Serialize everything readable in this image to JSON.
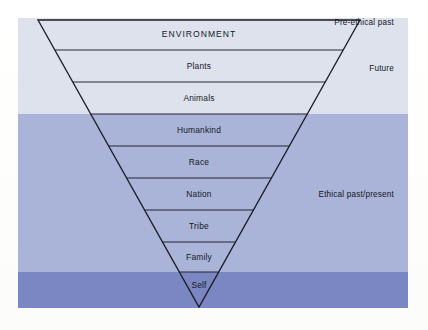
{
  "figure": {
    "type": "inverted-triangle-hierarchy-diagram",
    "palette": {
      "band_future": "#dde2ed",
      "band_ethical": "#aab4d8",
      "band_preethical": "#7b87c2",
      "line": "#1b1e26",
      "text": "#16181e",
      "page": "#fdfdfb"
    }
  },
  "triangle": {
    "rows": [
      {
        "label": "ENVIRONMENT",
        "caps": true,
        "center_x": 199,
        "center_y": 34
      },
      {
        "label": "Plants",
        "caps": false,
        "center_x": 199,
        "center_y": 66
      },
      {
        "label": "Animals",
        "caps": false,
        "center_x": 199,
        "center_y": 98
      },
      {
        "label": "Humankind",
        "caps": false,
        "center_x": 199,
        "center_y": 130
      },
      {
        "label": "Race",
        "caps": false,
        "center_x": 199,
        "center_y": 162
      },
      {
        "label": "Nation",
        "caps": false,
        "center_x": 199,
        "center_y": 194
      },
      {
        "label": "Tribe",
        "caps": false,
        "center_x": 199,
        "center_y": 226
      },
      {
        "label": "Family",
        "caps": false,
        "center_x": 199,
        "center_y": 257
      },
      {
        "label": "Self",
        "caps": false,
        "center_x": 199,
        "center_y": 285
      }
    ],
    "apex": {
      "x": 199,
      "y": 307
    },
    "top_left": {
      "x": 38,
      "y": 20
    },
    "top_right": {
      "x": 360,
      "y": 20
    },
    "divider_y": [
      50,
      82,
      114,
      146,
      178,
      210,
      242,
      272
    ]
  },
  "bands": [
    {
      "name": "Future",
      "label": "Future",
      "color": "#dde2ed"
    },
    {
      "name": "Ethical past/present",
      "label": "Ethical past/present",
      "color": "#aab4d8"
    },
    {
      "name": "Pre-ethical past",
      "label": "Pre-ethical past",
      "color": "#7b87c2"
    }
  ],
  "chart_data": {
    "type": "diagram",
    "title": "",
    "categories": [
      "ENVIRONMENT",
      "Plants",
      "Animals",
      "Humankind",
      "Race",
      "Nation",
      "Tribe",
      "Family",
      "Self"
    ],
    "values": [
      9,
      8,
      7,
      6,
      5,
      4,
      3,
      2,
      1
    ],
    "groups": [
      {
        "name": "Future",
        "members": [
          "ENVIRONMENT",
          "Plants",
          "Animals"
        ]
      },
      {
        "name": "Ethical past/present",
        "members": [
          "Humankind",
          "Race",
          "Nation",
          "Tribe",
          "Family"
        ]
      },
      {
        "name": "Pre-ethical past",
        "members": [
          "Self"
        ]
      }
    ],
    "xlabel": "",
    "ylabel": "",
    "legend_position": "right"
  }
}
